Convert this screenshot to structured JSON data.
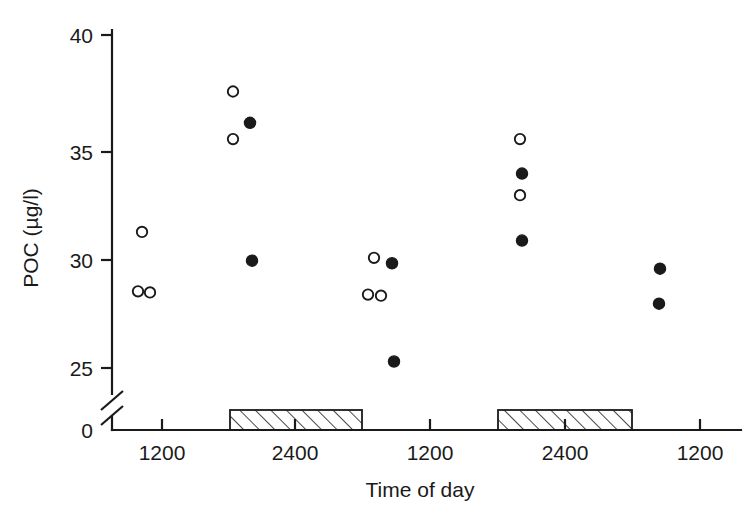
{
  "chart_data": {
    "type": "scatter",
    "title": "",
    "xlabel": "Time of day",
    "ylabel": "POC (µg/l)",
    "xlim": [
      1100,
      2800
    ],
    "ylim": [
      0,
      40
    ],
    "grid": false,
    "legend": "none",
    "y_axis_break": {
      "between": [
        0,
        25
      ],
      "present": true
    },
    "y_ticks": [
      {
        "value": 0,
        "label": "0",
        "py": 428
      },
      {
        "value": 25,
        "label": "25",
        "py": 368
      },
      {
        "value": 30,
        "label": "30",
        "py": 260
      },
      {
        "value": 35,
        "label": "35",
        "py": 152
      },
      {
        "value": 40,
        "label": "40",
        "py": 35
      }
    ],
    "x_ticks": [
      {
        "label": "1200",
        "px": 162
      },
      {
        "label": "2400",
        "px": 295
      },
      {
        "label": "1200",
        "px": 430
      },
      {
        "label": "2400",
        "px": 565
      },
      {
        "label": "1200",
        "px": 700
      }
    ],
    "series": [
      {
        "name": "open-circles",
        "marker": "open-circle",
        "points": [
          {
            "px": 142,
            "value": 31.3
          },
          {
            "px": 138,
            "value": 28.55
          },
          {
            "px": 150,
            "value": 28.5
          },
          {
            "px": 233,
            "value": 37.8
          },
          {
            "px": 233,
            "value": 35.6
          },
          {
            "px": 374,
            "value": 30.1
          },
          {
            "px": 368,
            "value": 28.4
          },
          {
            "px": 381,
            "value": 28.35
          },
          {
            "px": 520,
            "value": 35.6
          },
          {
            "px": 520,
            "value": 33.0
          }
        ]
      },
      {
        "name": "filled-circles",
        "marker": "filled-circle",
        "points": [
          {
            "px": 250,
            "value": 36.35
          },
          {
            "px": 252,
            "value": 29.97
          },
          {
            "px": 392,
            "value": 29.85
          },
          {
            "px": 394,
            "value": 25.3
          },
          {
            "px": 522,
            "value": 34.0
          },
          {
            "px": 522,
            "value": 30.9
          },
          {
            "px": 660,
            "value": 29.6
          },
          {
            "px": 659,
            "value": 27.98
          }
        ]
      }
    ],
    "night_bars": [
      {
        "name": "night-period-1",
        "x_start": 230,
        "x_end": 362,
        "label": "dark period"
      },
      {
        "name": "night-period-2",
        "x_start": 498,
        "x_end": 632,
        "label": "dark period"
      }
    ]
  }
}
